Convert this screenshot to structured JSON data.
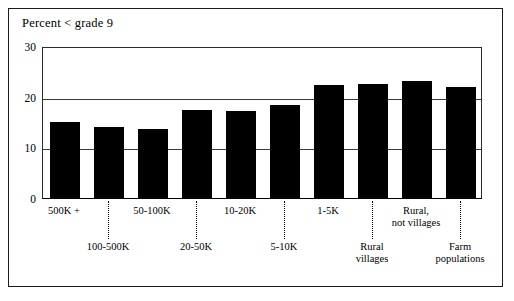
{
  "chart_data": {
    "type": "bar",
    "title": "Percent < grade 9",
    "xlabel": "",
    "ylabel": "",
    "ylim": [
      0,
      30
    ],
    "yticks": [
      0,
      10,
      20,
      30
    ],
    "ytick_labels": [
      "0",
      "10",
      "20",
      "30"
    ],
    "grid": true,
    "legend": "none",
    "bar_color": "#000000",
    "categories": [
      "500K +",
      "100-500K",
      "50-100K",
      "20-50K",
      "10-20K",
      "5-10K",
      "1-5K",
      "Rural villages",
      "Rural, not villages",
      "Farm populations"
    ],
    "category_label_lines": [
      [
        "500K +"
      ],
      [
        "100-500K"
      ],
      [
        "50-100K"
      ],
      [
        "20-50K"
      ],
      [
        "10-20K"
      ],
      [
        "5-10K"
      ],
      [
        "1-5K"
      ],
      [
        "Rural",
        "villages"
      ],
      [
        "Rural,",
        "not villages"
      ],
      [
        "Farm",
        "populations"
      ]
    ],
    "values": [
      15.0,
      14.0,
      13.7,
      17.3,
      17.1,
      18.4,
      22.3,
      22.6,
      23.1,
      22.0
    ]
  },
  "frame": {
    "border_color": "#1b1b1b"
  }
}
